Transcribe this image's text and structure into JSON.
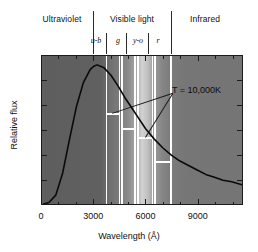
{
  "figure": {
    "caption_regions": [
      {
        "label": "Ultraviolet",
        "left": 31,
        "width": 62,
        "center": 62
      },
      {
        "label": "Visible light",
        "left": 95,
        "width": 74,
        "center": 132
      },
      {
        "label": "Infrared",
        "left": 175,
        "width": 60,
        "center": 205
      }
    ],
    "region_dividers": [
      93,
      171
    ],
    "filters": [
      {
        "label": "u-b",
        "center": 96
      },
      {
        "label": "g",
        "center": 118
      },
      {
        "label": "y-o",
        "center": 138
      },
      {
        "label": "r",
        "center": 158
      }
    ],
    "annotation": {
      "text": "T = 10,000K"
    }
  },
  "chart_data": {
    "type": "line",
    "title": "",
    "xlabel": "Wavelength (Å)",
    "ylabel": "Relative flux",
    "xlim": [
      0,
      11600
    ],
    "ylim": [
      0,
      1.0
    ],
    "xticks": [
      0,
      3000,
      6000,
      9000
    ],
    "xtick_labels": [
      "0",
      "3000",
      "6000",
      "9000"
    ],
    "x_minor_step": 1000,
    "ytick_count": 6,
    "grid": false,
    "legend": "none",
    "series": [
      {
        "name": "Blackbody 10,000 K",
        "description": "Planck blackbody spectral flux for T = 10,000 K",
        "x": [
          100,
          400,
          800,
          1200,
          1600,
          2000,
          2400,
          2800,
          3000,
          3200,
          3600,
          4000,
          4400,
          4800,
          5200,
          5600,
          6000,
          6500,
          7000,
          7500,
          8000,
          8500,
          9000,
          9500,
          10000,
          10500,
          11000,
          11600
        ],
        "y": [
          0.0,
          0.01,
          0.06,
          0.21,
          0.44,
          0.66,
          0.82,
          0.91,
          0.93,
          0.94,
          0.92,
          0.87,
          0.8,
          0.72,
          0.65,
          0.58,
          0.51,
          0.44,
          0.38,
          0.33,
          0.29,
          0.26,
          0.23,
          0.2,
          0.18,
          0.16,
          0.15,
          0.13
        ]
      }
    ],
    "passbands": [
      {
        "name": "u-b",
        "x_start": 3700,
        "x_end": 4450,
        "level": 0.62,
        "color": "#7d7d7d"
      },
      {
        "name": "g",
        "x_start": 4600,
        "x_end": 5350,
        "level": 0.52,
        "color": "#8e8e8e"
      },
      {
        "name": "y-o",
        "x_start": 5500,
        "x_end": 6350,
        "level": 0.46,
        "color": "#b9b9b9"
      },
      {
        "name": "r",
        "x_start": 6500,
        "x_end": 7400,
        "level": 0.3,
        "color": "#8a8a8a"
      }
    ],
    "background_description": "Grey spectral strip, darker in ultraviolet and infrared, brightest across the visible band near 5500-6000 angstrom"
  }
}
